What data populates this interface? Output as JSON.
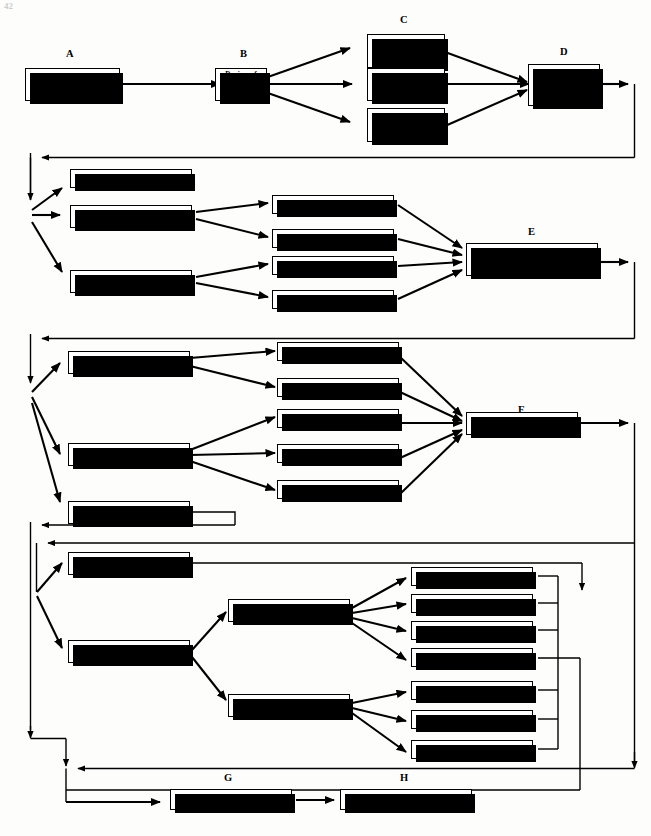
{
  "page": {
    "corner_mark": "42",
    "width": 651,
    "height": 836
  },
  "tags": {
    "a": "A",
    "b": "B",
    "c": "C",
    "d": "D",
    "e": "E",
    "f": "F",
    "g": "G",
    "h": "H"
  },
  "stage1": {
    "a": "Formulation of\nResearch Problem",
    "b": "Review of\nRelated Research",
    "c1": "Clarification of\nConcepts",
    "c2": "Identification of\nVariables",
    "c3": "Statement of\nHypotheses",
    "d": "Selection of\nResearch\nDesign"
  },
  "stage2": {
    "designs": [
      "Exploratory",
      "Descriptive",
      "Causal"
    ],
    "methods": [
      "Surveys",
      "Case Studies",
      "Laboratory Experiments",
      "Field Experiments"
    ],
    "e": "Selection of Data Collection\nTechnique"
  },
  "stage3": {
    "sources": [
      "Observation",
      "Direct Communication",
      "Secondary Data"
    ],
    "techniques": [
      "Participant",
      "Nonparticipant",
      "Questionnaires",
      "Interviews",
      "Projective"
    ],
    "f": "Selection of Subjects"
  },
  "stage4": {
    "units": [
      "Census",
      "Samples"
    ],
    "sample_types": [
      "Probability",
      "Nonprobability"
    ],
    "probability_kinds": [
      "Random",
      "Systematic",
      "Stratified",
      "Cluster"
    ],
    "nonprobability_kinds": [
      "Judgmental",
      "Quota",
      "Convenience"
    ]
  },
  "stage5": {
    "g": "Planning of Data Coding",
    "h": "Planning of Data Analysis"
  },
  "colors": {
    "ink": "#000000",
    "paper": "#fdfdfc",
    "box_fill": "#ffffff"
  }
}
